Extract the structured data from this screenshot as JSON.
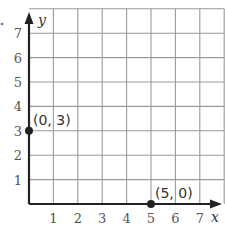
{
  "chart_data": {
    "type": "scatter",
    "title": "",
    "xlabel": "x",
    "ylabel": "y",
    "xlim": [
      0,
      8
    ],
    "ylim": [
      0,
      8
    ],
    "grid": true,
    "x_ticks": [
      "1",
      "2",
      "3",
      "4",
      "5",
      "6",
      "7"
    ],
    "y_ticks": [
      "1",
      "2",
      "3",
      "4",
      "5",
      "6",
      "7"
    ],
    "series": [
      {
        "name": "points",
        "points": [
          {
            "x": 0,
            "y": 3,
            "label": "(0, 3)"
          },
          {
            "x": 5,
            "y": 0,
            "label": "(5, 0)"
          }
        ]
      }
    ],
    "colors": {
      "grid": "#9a9a9a",
      "axis": "#222222",
      "point": "#222222"
    }
  }
}
